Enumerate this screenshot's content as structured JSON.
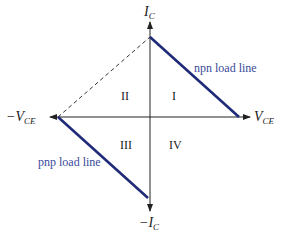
{
  "diagram": {
    "axes": {
      "y_pos_label": "I",
      "y_pos_sub": "C",
      "y_neg_label": "−I",
      "y_neg_sub": "C",
      "x_pos_label": "V",
      "x_pos_sub": "CE",
      "x_neg_label": "−V",
      "x_neg_sub": "CE"
    },
    "quadrants": {
      "q1": "I",
      "q2": "II",
      "q3": "III",
      "q4": "IV"
    },
    "lines": {
      "npn_label": "npn load line",
      "pnp_label": "pnp load line"
    },
    "colors": {
      "load_line": "#1f2a78",
      "label": "#3a4a9a",
      "axis": "#222222"
    }
  }
}
